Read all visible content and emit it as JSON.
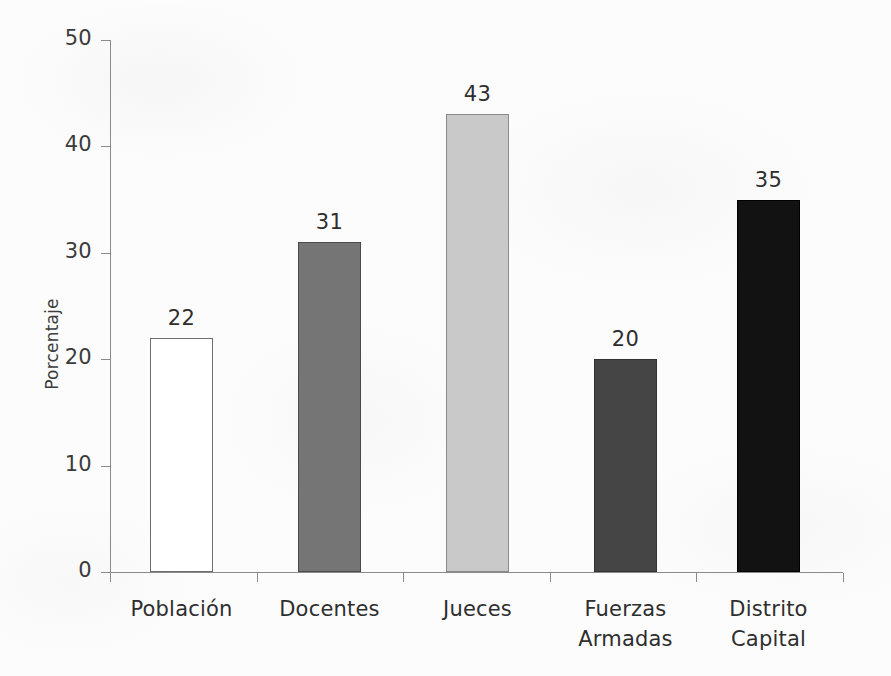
{
  "chart_data": {
    "type": "bar",
    "title": "",
    "subtitle": "",
    "xlabel": "",
    "ylabel": "Porcentaje",
    "categories": [
      "Población",
      "Docentes",
      "Jueces",
      "Fuerzas Armadas",
      "Distrito Capital"
    ],
    "values": [
      22,
      31,
      43,
      20,
      35
    ],
    "data_labels": [
      "22",
      "31",
      "43",
      "20",
      "35"
    ],
    "ylim": [
      0,
      50
    ],
    "ytick_labels": [
      "0",
      "10",
      "20",
      "30",
      "40",
      "50"
    ],
    "ytick_values": [
      0,
      10,
      20,
      30,
      40,
      50
    ],
    "grid": false,
    "legend": "none",
    "bar_colors": [
      "#ffffff",
      "#757575",
      "#c9c9c9",
      "#454545",
      "#121212"
    ],
    "bar_edge_colors": [
      "#6e6e6e",
      "#4a4a4a",
      "#8a8a8a",
      "#333333",
      "#000000"
    ],
    "axis_color": "#8a8a8a",
    "background_color": "#fcfcfc",
    "text_color": "#2e2e2e"
  }
}
